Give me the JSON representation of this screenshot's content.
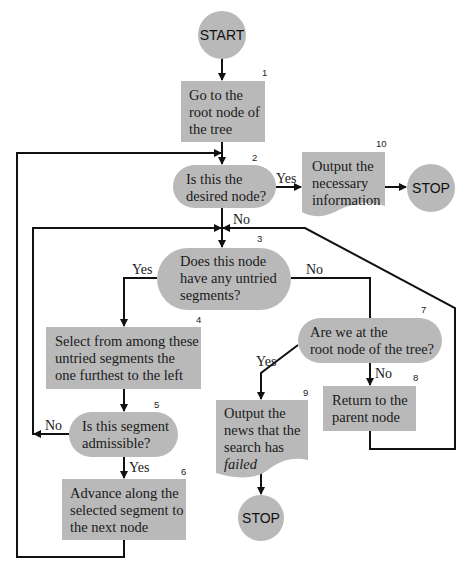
{
  "diagram": {
    "type": "flowchart",
    "colors": {
      "shape_fill": "#b9b9b9",
      "line": "#111111",
      "background": "#ffffff"
    },
    "nodes": {
      "start": {
        "label": "START",
        "shape": "circle"
      },
      "n1": {
        "num": "1",
        "shape": "process",
        "lines": [
          "Go to the",
          "root node of",
          "the tree"
        ]
      },
      "n2": {
        "num": "2",
        "shape": "decision",
        "lines": [
          "Is this the",
          "desired node?"
        ]
      },
      "n10": {
        "num": "10",
        "shape": "document",
        "lines": [
          "Output the",
          "necessary",
          "information"
        ]
      },
      "stop1": {
        "label": "STOP",
        "shape": "circle"
      },
      "n3": {
        "num": "3",
        "shape": "decision",
        "lines": [
          "Does this node",
          "have any untried",
          "segments?"
        ]
      },
      "n4": {
        "num": "4",
        "shape": "process",
        "lines": [
          "Select from among these",
          "untried segments the",
          "one furthest to the left"
        ]
      },
      "n5": {
        "num": "5",
        "shape": "decision",
        "lines": [
          "Is this segment",
          "admissible?"
        ]
      },
      "n6": {
        "num": "6",
        "shape": "process",
        "lines": [
          "Advance along the",
          "selected segment to",
          "the next node"
        ]
      },
      "n7": {
        "num": "7",
        "shape": "decision",
        "lines": [
          "Are we at the",
          "root node of the tree?"
        ]
      },
      "n8": {
        "num": "8",
        "shape": "process",
        "lines": [
          "Return to the",
          "parent node"
        ]
      },
      "n9": {
        "num": "9",
        "shape": "document",
        "lines": [
          "Output the",
          "news that the",
          "search has"
        ],
        "italic_line": "failed"
      },
      "stop2": {
        "label": "STOP",
        "shape": "circle"
      }
    },
    "edge_labels": {
      "n2_yes": "Yes",
      "n2_no": "No",
      "n3_yes": "Yes",
      "n3_no": "No",
      "n5_no": "No",
      "n5_yes": "Yes",
      "n7_yes": "Yes",
      "n7_no": "No"
    },
    "edges": [
      {
        "from": "start",
        "to": "n1"
      },
      {
        "from": "n1",
        "to": "n2"
      },
      {
        "from": "n2",
        "to": "n10",
        "label": "Yes"
      },
      {
        "from": "n10",
        "to": "stop1"
      },
      {
        "from": "n2",
        "to": "n3",
        "label": "No"
      },
      {
        "from": "n3",
        "to": "n4",
        "label": "Yes"
      },
      {
        "from": "n3",
        "to": "n7",
        "label": "No"
      },
      {
        "from": "n4",
        "to": "n5"
      },
      {
        "from": "n5",
        "to": "n3",
        "label": "No"
      },
      {
        "from": "n5",
        "to": "n6",
        "label": "Yes"
      },
      {
        "from": "n6",
        "to": "n2"
      },
      {
        "from": "n7",
        "to": "n9",
        "label": "Yes"
      },
      {
        "from": "n7",
        "to": "n8",
        "label": "No"
      },
      {
        "from": "n8",
        "to": "n3"
      },
      {
        "from": "n9",
        "to": "stop2"
      }
    ]
  }
}
